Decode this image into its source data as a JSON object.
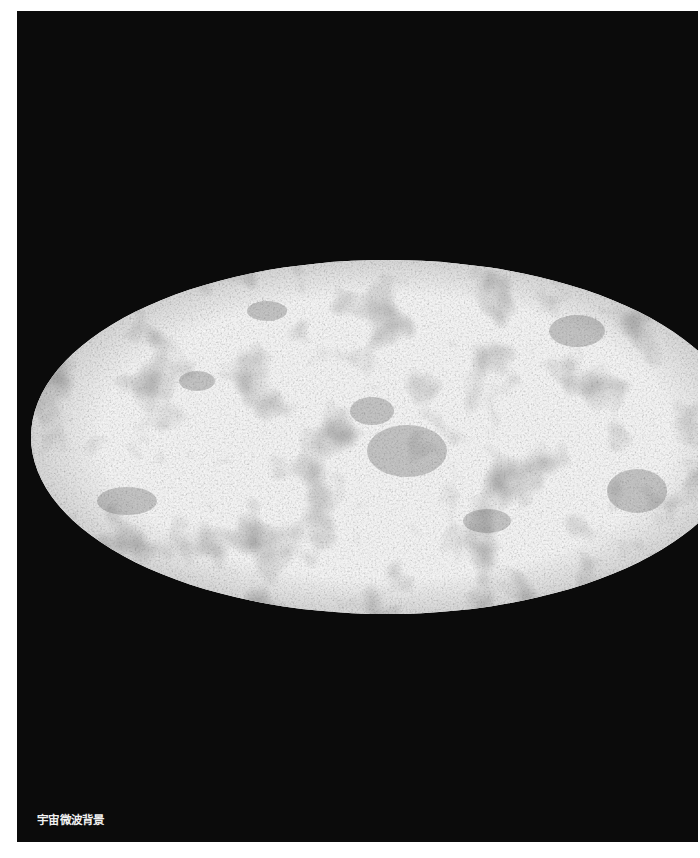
{
  "figure": {
    "caption": "宇宙微波背景",
    "projection": "mollweide-ellipse",
    "colors": {
      "background": "#0b0b0b",
      "page": "#ffffff",
      "map_light": "#e8e8e8",
      "map_dark": "#5a5a5a",
      "caption_text": "#f2f2f2"
    }
  }
}
